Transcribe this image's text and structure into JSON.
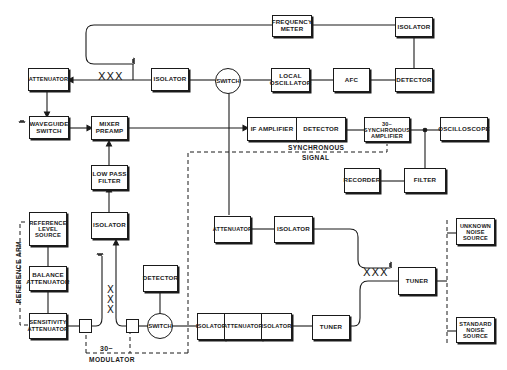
{
  "diagram": {
    "type": "block-diagram",
    "title": "",
    "blocks": {
      "frequency_meter": "FREQUENCY\nMETER",
      "isolator_top_right": "ISOLATOR",
      "attenuator_top_left": "ATTENUATOR",
      "isolator_top_mid": "ISOLATOR",
      "switch_top": "SWITCH",
      "local_oscillator": "LOCAL\nOSCILLATOR",
      "afc": "AFC",
      "detector_top_right": "DETECTOR",
      "waveguide_switch": "WAVEGUIDE\nSWITCH",
      "mixer_preamp": "MIXER\nPREAMP",
      "if_amplifier": "IF AMPLIFIER",
      "detector_if": "DETECTOR",
      "synchronous_amplifier": "30~\nSYNCHRONOUS\nAMPLIFIER",
      "oscilloscope": "OSCILLOSCOPE",
      "recorder": "RECORDER",
      "filter": "FILTER",
      "low_pass_filter": "LOW PASS\nFILTER",
      "reference_level_source": "REFERENCE\nLEVEL\nSOURCE",
      "isolator_mid_left": "ISOLATOR",
      "attenuator_mid": "ATTENUATOR",
      "isolator_mid": "ISOLATOR",
      "balance_attenuator": "BALANCE\nATTENUATOR",
      "detector_bottom": "DETECTOR",
      "sensitivity_attenuator": "SENSITIVITY\nATTENUATOR",
      "switch_bottom": "SWITCH",
      "isolator_bottom_1": "ISOLATOR",
      "attenuator_bottom": "ATTENUATOR",
      "isolator_bottom_2": "ISOLATOR",
      "tuner_bottom": "TUNER",
      "tuner_right": "TUNER",
      "unknown_noise_source": "UNKNOWN\nNOISE\nSOURCE",
      "standard_noise_source": "STANDARD\nNOISE\nSOURCE"
    },
    "labels": {
      "synchronous_signal_1": "SYNCHRONOUS",
      "synchronous_signal_2": "SIGNAL",
      "reference_arm": "REFERENCE ARM",
      "modulator_freq": "30~",
      "modulator": "MODULATOR",
      "coupler_top": "XXX",
      "coupler_left": "X\nX\nX",
      "coupler_right": "XXX"
    },
    "colors": {
      "line": "#1a1a1a",
      "background": "#ffffff"
    }
  }
}
